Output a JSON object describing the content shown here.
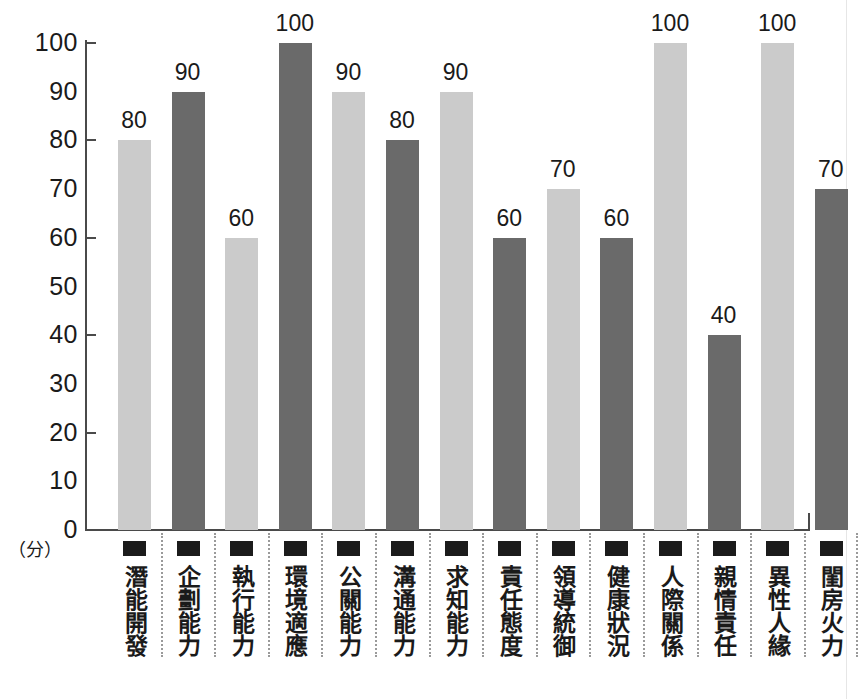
{
  "chart_data": {
    "type": "bar",
    "title": "",
    "xlabel": "",
    "ylabel": "",
    "unit_label": "（分）",
    "ylim": [
      0,
      100
    ],
    "grid": false,
    "legend": "none",
    "y_tick_labels": [
      "100",
      "90",
      "80",
      "70",
      "60",
      "50",
      "40",
      "30",
      "20",
      "10",
      "0"
    ],
    "y_tick_values": [
      100,
      90,
      80,
      70,
      60,
      50,
      40,
      30,
      20,
      10,
      0
    ],
    "y_ticks_with_marks": [
      100,
      80,
      60,
      40,
      20,
      0
    ],
    "categories": [
      "潛能開發",
      "企劃能力",
      "執行能力",
      "環境適應",
      "公關能力",
      "溝通能力",
      "求知能力",
      "責任態度",
      "領導統御",
      "健康狀況",
      "人際關係",
      "親情責任",
      "異性人緣",
      "閨房火力"
    ],
    "values": [
      80,
      90,
      60,
      100,
      90,
      80,
      90,
      60,
      70,
      60,
      100,
      40,
      100,
      70
    ],
    "value_labels": [
      "80",
      "90",
      "60",
      "100",
      "90",
      "80",
      "90",
      "60",
      "70",
      "60",
      "100",
      "40",
      "100",
      "70"
    ],
    "bar_shades": [
      "light",
      "dark",
      "light",
      "dark",
      "light",
      "dark",
      "light",
      "dark",
      "light",
      "dark",
      "light",
      "dark",
      "light",
      "dark"
    ],
    "colors": {
      "light_bar": "#cbcbcb",
      "dark_bar": "#6a6a6a",
      "axis": "#4a4a4a",
      "text": "#1a1a1a",
      "marker": "#1b1b1b",
      "separator": "#9a9a9a",
      "background": "#ffffff"
    }
  }
}
